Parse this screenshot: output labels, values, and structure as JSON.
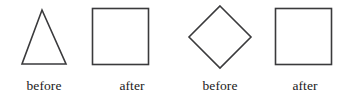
{
  "canvas": {
    "width": 346,
    "height": 103,
    "background": "#ffffff",
    "stroke_color": "#3a3a3c",
    "text_color": "#1a1a1a"
  },
  "figure": {
    "items": [
      {
        "shape": "triangle",
        "shape_icon": "triangle-outline-icon",
        "caption": "before",
        "bbox": {
          "x": 22,
          "y": 10,
          "width": 44,
          "height": 54
        }
      },
      {
        "shape": "square",
        "shape_icon": "square-outline-icon",
        "caption": "after",
        "bbox": {
          "x": 92,
          "y": 8,
          "width": 56,
          "height": 56
        }
      },
      {
        "shape": "diamond",
        "shape_icon": "diamond-outline-icon",
        "caption": "before",
        "bbox": {
          "x": 189,
          "y": 6,
          "width": 62,
          "height": 62
        }
      },
      {
        "shape": "square",
        "shape_icon": "square-outline-icon",
        "caption": "after",
        "bbox": {
          "x": 275,
          "y": 8,
          "width": 56,
          "height": 56
        }
      }
    ]
  }
}
